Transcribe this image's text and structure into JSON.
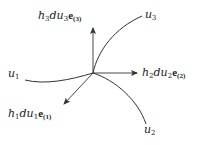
{
  "diagram": {
    "type": "curvilinear-coordinate-frame",
    "stroke_color": "#333333",
    "origin": {
      "x": 93,
      "y": 73
    },
    "curves": [
      {
        "id": "u1",
        "label": "u",
        "sub": "1"
      },
      {
        "id": "u2",
        "label": "u",
        "sub": "2"
      },
      {
        "id": "u3",
        "label": "u",
        "sub": "3"
      }
    ],
    "vectors": [
      {
        "id": "e1",
        "scale": "h",
        "scale_sub": "1",
        "diff": "du",
        "diff_sub": "1",
        "basis": "e",
        "basis_sub": "(1)",
        "direction": "lower-left"
      },
      {
        "id": "e2",
        "scale": "h",
        "scale_sub": "2",
        "diff": "du",
        "diff_sub": "2",
        "basis": "e",
        "basis_sub": "(2)",
        "direction": "right"
      },
      {
        "id": "e3",
        "scale": "h",
        "scale_sub": "3",
        "diff": "du",
        "diff_sub": "3",
        "basis": "e",
        "basis_sub": "(3)",
        "direction": "up"
      }
    ]
  }
}
